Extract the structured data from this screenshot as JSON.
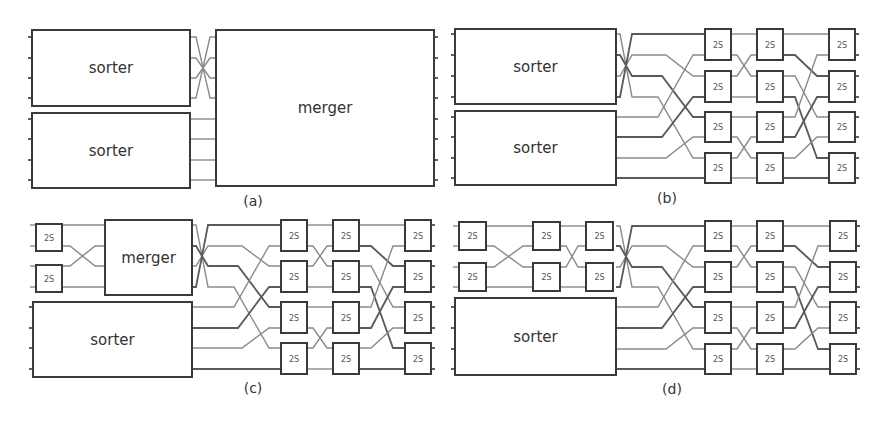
{
  "figure": {
    "panels": [
      {
        "id": "a",
        "caption": "(a)",
        "caption_pos": [
          253,
          206
        ],
        "blocks": [
          {
            "label": "sorter",
            "x": 32,
            "y": 30,
            "w": 158,
            "h": 76
          },
          {
            "label": "sorter",
            "x": 32,
            "y": 113,
            "w": 158,
            "h": 75
          },
          {
            "label": "merger",
            "x": 216,
            "y": 30,
            "w": 218,
            "h": 156
          }
        ],
        "lines_y": [
          37,
          58,
          78,
          98,
          119,
          139,
          160,
          180
        ],
        "network": null
      },
      {
        "id": "b",
        "caption": "(b)",
        "caption_pos": [
          667,
          203
        ],
        "blocks": [
          {
            "label": "sorter",
            "x": 455,
            "y": 29,
            "w": 161,
            "h": 75
          },
          {
            "label": "sorter",
            "x": 455,
            "y": 111,
            "w": 161,
            "h": 74
          }
        ],
        "lines_y": [
          34,
          55,
          76,
          97,
          117,
          137,
          158,
          178
        ],
        "network": {
          "src_x": 616,
          "stage_x": [
            705,
            757,
            829
          ],
          "box_w": 26
        }
      },
      {
        "id": "c",
        "caption": "(c)",
        "caption_pos": [
          253,
          393
        ],
        "blocks": [
          {
            "label": "merger",
            "x": 105,
            "y": 220,
            "w": 87,
            "h": 75
          },
          {
            "label": "sorter",
            "x": 33,
            "y": 302,
            "w": 159,
            "h": 75
          }
        ],
        "pre_boxes": [
          {
            "label": "2S",
            "x": 36,
            "y": 224,
            "w": 26,
            "h": 27
          },
          {
            "label": "2S",
            "x": 36,
            "y": 265,
            "w": 26,
            "h": 27
          }
        ],
        "lines_y": [
          225,
          246,
          266,
          287,
          307,
          328,
          348,
          369
        ],
        "network": {
          "src_x": 192,
          "stage_x": [
            281,
            333,
            405
          ],
          "box_w": 26
        }
      },
      {
        "id": "d",
        "caption": "(d)",
        "caption_pos": [
          672,
          394
        ],
        "blocks": [
          {
            "label": "sorter",
            "x": 455,
            "y": 298,
            "w": 161,
            "h": 77
          }
        ],
        "pre_boxes": [
          {
            "label": "2S",
            "x": 459,
            "y": 222,
            "w": 27,
            "h": 28
          },
          {
            "label": "2S",
            "x": 459,
            "y": 263,
            "w": 27,
            "h": 28
          },
          {
            "label": "2S",
            "x": 533,
            "y": 222,
            "w": 27,
            "h": 28
          },
          {
            "label": "2S",
            "x": 533,
            "y": 263,
            "w": 27,
            "h": 28
          },
          {
            "label": "2S",
            "x": 586,
            "y": 222,
            "w": 27,
            "h": 28
          },
          {
            "label": "2S",
            "x": 586,
            "y": 263,
            "w": 27,
            "h": 28
          }
        ],
        "lines_y": [
          226,
          246,
          267,
          287,
          307,
          328,
          349,
          369
        ],
        "network": {
          "src_x": 616,
          "stage_x": [
            705,
            757,
            830
          ],
          "box_w": 26
        }
      }
    ],
    "comparator_label": "2S"
  }
}
